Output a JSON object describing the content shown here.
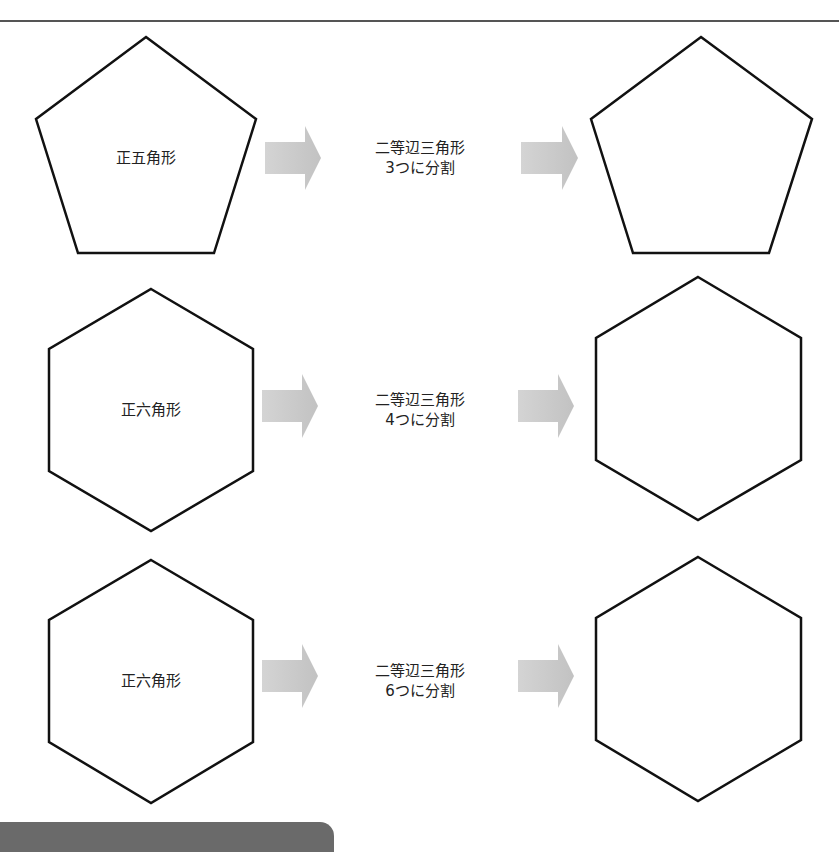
{
  "rows": [
    {
      "source_shape": "pentagon",
      "source_label": "正五角形",
      "step_line1": "二等辺三角形",
      "step_line2": "3つに分割",
      "result_shape": "pentagon"
    },
    {
      "source_shape": "hexagon",
      "source_label": "正六角形",
      "step_line1": "二等辺三角形",
      "step_line2": "4つに分割",
      "result_shape": "hexagon"
    },
    {
      "source_shape": "hexagon",
      "source_label": "正六角形",
      "step_line1": "二等辺三角形",
      "step_line2": "6つに分割",
      "result_shape": "hexagon"
    }
  ],
  "colors": {
    "stroke": "#111111",
    "arrow": "#c8c8c8",
    "rule": "#555555",
    "footer_tab": "#6a6a6a"
  }
}
